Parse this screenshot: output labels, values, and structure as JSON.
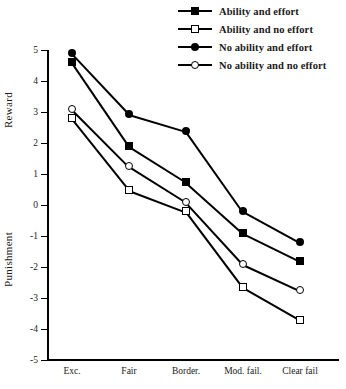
{
  "chart_data": {
    "type": "line",
    "title": "",
    "xlabel": "",
    "ylabel": "Reward / Punishment",
    "categories": [
      "Exc.",
      "Fair",
      "Border.",
      "Mod. fail.",
      "Clear fail"
    ],
    "ylim": [
      -5,
      5
    ],
    "yticks": [
      5,
      4,
      3,
      2,
      1,
      0,
      -1,
      -2,
      -3,
      -4,
      -5
    ],
    "ytick_labels": [
      "5",
      "4",
      "3",
      "2",
      "1",
      "0",
      "-1",
      "-2",
      "-3",
      "-4",
      "-5"
    ],
    "grid": false,
    "legend_position": "top-right",
    "axis_labels": {
      "upper": "Reward",
      "lower": "Punishment"
    },
    "series": [
      {
        "name": "Ability and effort",
        "marker": "filled-square",
        "values": [
          4.6,
          1.9,
          0.75,
          -0.9,
          -1.8
        ]
      },
      {
        "name": "Ability and no effort",
        "marker": "open-square",
        "values": [
          2.8,
          0.5,
          -0.2,
          -2.65,
          -3.7
        ]
      },
      {
        "name": "No ability and effort",
        "marker": "filled-circle",
        "values": [
          4.9,
          2.95,
          2.4,
          -0.2,
          -1.2
        ]
      },
      {
        "name": "No ability and no effort",
        "marker": "open-circle",
        "values": [
          3.1,
          1.25,
          0.1,
          -1.9,
          -2.75
        ]
      }
    ]
  },
  "legend": {
    "items": [
      {
        "label": "Ability and effort",
        "marker": "filled-square"
      },
      {
        "label": "Ability and no effort",
        "marker": "open-square"
      },
      {
        "label": "No ability and effort",
        "marker": "filled-circle"
      },
      {
        "label": "No ability and no effort",
        "marker": "open-circle"
      }
    ]
  },
  "colors": {
    "ink": "#000000",
    "background": "#ffffff"
  }
}
